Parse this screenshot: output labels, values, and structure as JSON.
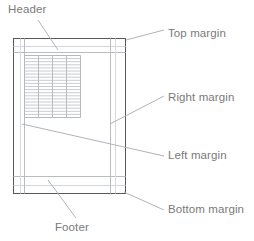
{
  "diagram": {
    "colors": {
      "page_border": "#595959",
      "guide_line": "#b9bcc2",
      "table_line": "#c9ccd1",
      "leader_line": "#b0b3b8",
      "label_text": "#7a7a7a",
      "page_fill": "#ffffff"
    },
    "page": {
      "x": 13,
      "y": 38,
      "width": 113,
      "height": 156
    },
    "guides": {
      "top_margin_y": 52,
      "bottom_margin_y": 177,
      "left_margin_x": 24,
      "right_margin_x": 110,
      "header_baseline_y": 47,
      "footer_baseline_y": 186
    },
    "content_table": {
      "x": 24,
      "y": 55,
      "width": 56,
      "height": 62,
      "columns": 4,
      "rows": 20
    }
  },
  "labels": {
    "header": "Header",
    "top_margin": "Top margin",
    "right_margin": "Right margin",
    "left_margin": "Left margin",
    "bottom_margin": "Bottom margin",
    "footer": "Footer"
  },
  "leaders": {
    "header": {
      "x1": 38,
      "y1": 20,
      "x2": 58,
      "y2": 50
    },
    "top_margin": {
      "x1": 126,
      "y1": 40,
      "x2": 164,
      "y2": 30
    },
    "right_margin": {
      "x1": 110,
      "y1": 124,
      "x2": 164,
      "y2": 96
    },
    "left_margin": {
      "x1": 22,
      "y1": 124,
      "x2": 164,
      "y2": 156
    },
    "bottom_margin": {
      "x1": 124,
      "y1": 192,
      "x2": 164,
      "y2": 210
    },
    "footer": {
      "x1": 76,
      "y1": 218,
      "x2": 48,
      "y2": 180
    }
  }
}
